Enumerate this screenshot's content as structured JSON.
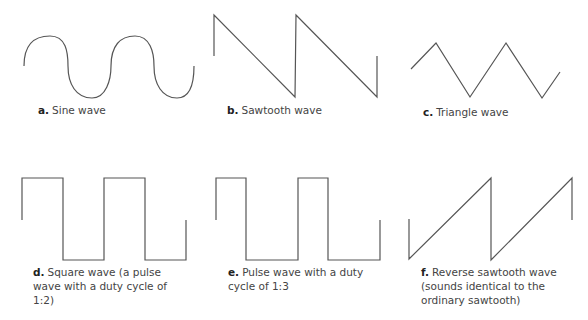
{
  "figure": {
    "panels": [
      {
        "letter": "a.",
        "caption": "Sine wave",
        "shape": "sine"
      },
      {
        "letter": "b.",
        "caption": "Sawtooth wave",
        "shape": "sawtooth"
      },
      {
        "letter": "c.",
        "caption": "Triangle wave",
        "shape": "triangle"
      },
      {
        "letter": "d.",
        "caption": "Square wave (a pulse wave with a duty cycle of 1:2)",
        "shape": "square"
      },
      {
        "letter": "e.",
        "caption": "Pulse wave with a duty cycle of 1:3",
        "shape": "pulse"
      },
      {
        "letter": "f.",
        "caption": "Reverse sawtooth wave (sounds identical to the ordinary sawtooth)",
        "shape": "reverse-sawtooth"
      }
    ]
  },
  "colors": {
    "stroke": "#555555",
    "text": "#444444"
  }
}
